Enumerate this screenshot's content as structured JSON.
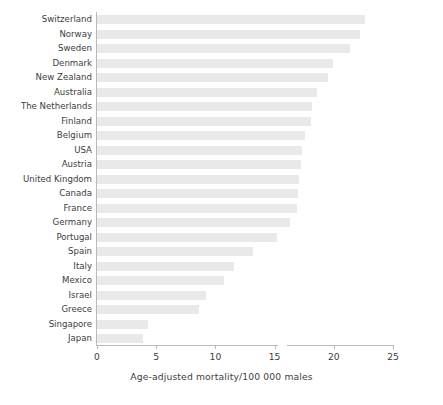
{
  "chart_data": {
    "type": "bar",
    "orientation": "horizontal",
    "title": "",
    "xlabel": "Age-adjusted mortality/100 000 males",
    "ylabel": "",
    "xlim": [
      0,
      25
    ],
    "xticks": [
      0,
      5,
      10,
      15,
      20,
      25
    ],
    "xtick_labels": [
      "0",
      "5",
      "10",
      "15",
      "20",
      "25"
    ],
    "grid": false,
    "legend": "none",
    "bar_color": "#e9e9e9",
    "axis_color": "#b9b9b9",
    "text_color": "#3d3d3d",
    "categories": [
      "Switzerland",
      "Norway",
      "Sweden",
      "Denmark",
      "New Zealand",
      "Australia",
      "The Netherlands",
      "Finland",
      "Belgium",
      "USA",
      "Austria",
      "United Kingdom",
      "Canada",
      "France",
      "Germany",
      "Portugal",
      "Spain",
      "Italy",
      "Mexico",
      "Israel",
      "Greece",
      "Singapore",
      "Japan"
    ],
    "values": [
      22.6,
      22.2,
      21.4,
      19.9,
      19.5,
      18.6,
      18.2,
      18.1,
      17.6,
      17.3,
      17.2,
      17.1,
      17.0,
      16.9,
      16.3,
      15.2,
      13.2,
      11.6,
      10.7,
      9.2,
      8.6,
      4.3,
      3.9
    ]
  }
}
